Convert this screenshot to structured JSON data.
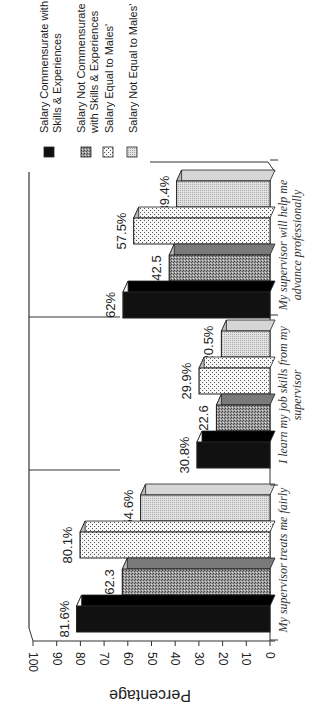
{
  "chart_data": {
    "type": "bar",
    "style": "3d-clustered-bar",
    "orientation_note": "page rotated 90 degrees; bars grow leftward in screen space",
    "title": "",
    "xlabel": "",
    "ylabel": "Percentage",
    "ylim": [
      0,
      100
    ],
    "yticks": [
      0,
      10,
      20,
      30,
      40,
      50,
      60,
      70,
      80,
      90,
      100
    ],
    "grid": false,
    "legend_position": "top",
    "categories": [
      "My supervisor treats me fairly",
      "I learn my job skills from my supervisor",
      "My supervisor will help me advance professionally"
    ],
    "category_lines": [
      [
        "My supervisor treats me fairly"
      ],
      [
        "I learn my job skills from my",
        "supervisor"
      ],
      [
        "My supervisor will help me",
        "advance professionally"
      ]
    ],
    "series": [
      {
        "name": "Salary Commensurate with Skills & Experiences",
        "legend_lines": [
          "Salary Commensurate with",
          "Skills & Experiences"
        ],
        "pattern": "solid-black",
        "color": "#111111",
        "values": [
          81.6,
          30.8,
          62
        ],
        "labels": [
          "81.6%",
          "30.8%",
          "62%"
        ]
      },
      {
        "name": "Salary Not Commensurate with Skills & Experiences",
        "legend_lines": [
          "Salary Not Commensurate",
          "with Skills & Experiences"
        ],
        "pattern": "dense-stipple",
        "color": "#8a8a8a",
        "values": [
          62.3,
          22.6,
          42.5
        ],
        "labels": [
          "62.3",
          "22.6",
          "42.5"
        ]
      },
      {
        "name": "Salary Equal to Males'",
        "legend_lines": [
          "Salary Equal to Males'"
        ],
        "pattern": "sparse-dots",
        "color": "#f0f0f0",
        "values": [
          80.1,
          29.9,
          57.5
        ],
        "labels": [
          "80.1%",
          "29.9%",
          "57.5%"
        ]
      },
      {
        "name": "Salary Not Equal to Males'",
        "legend_lines": [
          "Salary Not Equal to Males'"
        ],
        "pattern": "light-stipple",
        "color": "#cfcfcf",
        "values": [
          54.6,
          20.5,
          39.4
        ],
        "labels": [
          "54.6%",
          "20.5%",
          "39.4%"
        ]
      }
    ]
  }
}
